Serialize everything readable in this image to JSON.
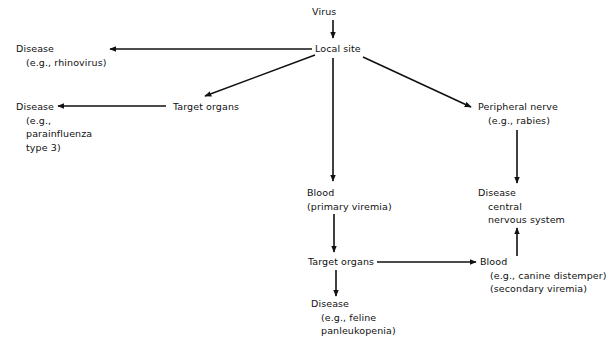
{
  "diagram": {
    "type": "flowchart",
    "nodes": {
      "virus": {
        "label": "Virus"
      },
      "local_site": {
        "label": "Local site"
      },
      "disease_local": {
        "label": "Disease",
        "sub": [
          "(e.g., rhinovirus)"
        ]
      },
      "target_organs_1": {
        "label": "Target organs"
      },
      "disease_target": {
        "label": "Disease",
        "sub": [
          "(e.g.,",
          "parainfluenza",
          "type 3)"
        ]
      },
      "peripheral_nerve": {
        "label": "Peripheral nerve",
        "sub": [
          "(e.g., rabies)"
        ]
      },
      "disease_cns": {
        "label": "Disease",
        "sub": [
          "central",
          "nervous system"
        ]
      },
      "blood_primary": {
        "label": "Blood",
        "sub": [
          "(primary viremia)"
        ]
      },
      "target_organs_2": {
        "label": "Target organs"
      },
      "blood_secondary": {
        "label": "Blood",
        "sub": [
          "(e.g., canine distemper)",
          "(secondary viremia)"
        ]
      },
      "disease_feline": {
        "label": "Disease",
        "sub": [
          "(e.g., feline",
          "panleukopenia)"
        ]
      }
    },
    "edges": [
      {
        "from": "virus",
        "to": "local_site"
      },
      {
        "from": "local_site",
        "to": "disease_local"
      },
      {
        "from": "local_site",
        "to": "target_organs_1"
      },
      {
        "from": "target_organs_1",
        "to": "disease_target"
      },
      {
        "from": "local_site",
        "to": "peripheral_nerve"
      },
      {
        "from": "peripheral_nerve",
        "to": "disease_cns"
      },
      {
        "from": "local_site",
        "to": "blood_primary"
      },
      {
        "from": "blood_primary",
        "to": "target_organs_2"
      },
      {
        "from": "target_organs_2",
        "to": "blood_secondary"
      },
      {
        "from": "target_organs_2",
        "to": "disease_feline"
      },
      {
        "from": "blood_secondary",
        "to": "disease_cns"
      }
    ],
    "colors": {
      "ink": "#111111",
      "background": "#ffffff"
    }
  }
}
